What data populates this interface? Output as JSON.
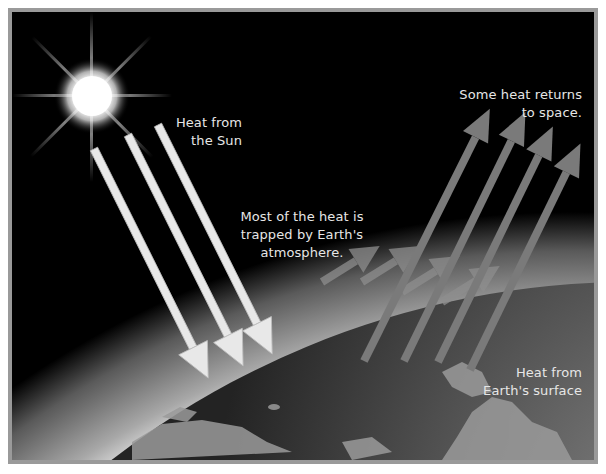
{
  "diagram": {
    "labels": {
      "sun_heat": "Heat from\nthe Sun",
      "trapped": "Most of the heat is\ntrapped by Earth's\natmosphere.",
      "returns": "Some heat returns\nto space.",
      "surface_heat": "Heat from\nEarth's surface"
    },
    "elements": {
      "sun": "sun-icon",
      "incoming_arrows": 3,
      "outgoing_arrows": 4,
      "trapped_arrows": 4
    },
    "colors": {
      "background": "#000000",
      "frame": "#9a9a9a",
      "incoming_arrow": "#e8e8e8",
      "outgoing_arrow": "#808080",
      "earth": "#4a4a4a",
      "atmosphere": "#bdbdbd",
      "text": "#e6e6e6"
    }
  }
}
